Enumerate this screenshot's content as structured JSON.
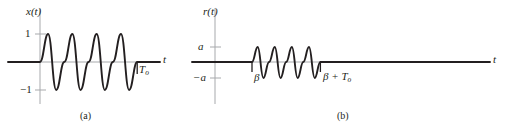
{
  "figure": {
    "background_color": "#ffffff",
    "curve_color": "#231f20",
    "axis_color": "#a7a9ac",
    "panels": [
      {
        "id": "a",
        "caption": "(a)",
        "vertical_axis_label": "x(t)",
        "horizontal_axis_label": "t",
        "y_ticks": [
          {
            "label": "1",
            "value": 1
          },
          {
            "label": "−1",
            "value": -1
          }
        ],
        "x_marks": [
          {
            "label": "T",
            "sub": "o",
            "value": "T_o"
          }
        ],
        "signal": {
          "name": "sinusoidal-burst",
          "cycles": 4,
          "amplitude": 1,
          "start": 0,
          "end": "T_o",
          "phase": "sine",
          "description": "four-cycle sinusoidal pulse of unit amplitude beginning at t = 0 and ending at t = T_o, zero elsewhere"
        }
      },
      {
        "id": "b",
        "caption": "(b)",
        "vertical_axis_label": "r(t)",
        "horizontal_axis_label": "t",
        "y_ticks": [
          {
            "label": "a",
            "value": "a"
          },
          {
            "label": "−a",
            "value": "-a"
          }
        ],
        "x_marks": [
          {
            "label": "β",
            "sub": "",
            "value": "beta"
          },
          {
            "label": "β + T",
            "sub": "o",
            "value": "beta_plus_T_o"
          }
        ],
        "signal": {
          "name": "delayed-attenuated-sinusoidal-burst",
          "cycles": 4,
          "amplitude": "a",
          "start": "β",
          "end": "β + T_o",
          "phase": "sine",
          "description": "four-cycle sinusoidal pulse of amplitude a delayed by beta, ending at beta + T_o, zero elsewhere"
        }
      }
    ]
  }
}
